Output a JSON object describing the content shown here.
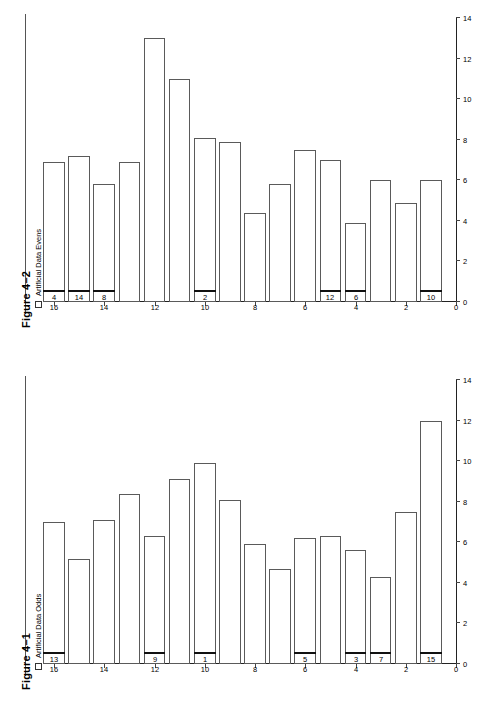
{
  "page": {
    "background": "#ffffff",
    "ink": "#000000"
  },
  "figures": [
    {
      "id": "figure-4-2",
      "title": "Figure 4–2",
      "legend": {
        "label": "Artificial Data Evens",
        "marker": "open-square"
      },
      "chart_data": {
        "type": "bar",
        "orientation": "horizontal-rotated",
        "title": "Figure 4–2",
        "xlabel": "",
        "ylabel": "",
        "legend": [
          "Artificial Data Evens"
        ],
        "legend_position": "top-left",
        "grid": false,
        "category_axis_label": "",
        "category_ticks": [
          0,
          2,
          4,
          6,
          8,
          10,
          12,
          14,
          16
        ],
        "category_axis_range": [
          0,
          16
        ],
        "value_axis_label": "",
        "value_ticks": [
          0,
          2,
          4,
          6,
          8,
          10,
          12,
          14
        ],
        "value_axis_range": [
          0,
          14
        ],
        "categories": [
          1,
          2,
          3,
          4,
          5,
          6,
          7,
          8,
          9,
          10,
          11,
          12,
          13,
          14,
          15,
          16
        ],
        "values": [
          6.0,
          4.9,
          6.0,
          3.9,
          7.0,
          7.5,
          5.8,
          4.4,
          7.9,
          8.1,
          11.0,
          13.0,
          6.9,
          5.8,
          7.2,
          6.9
        ],
        "point_labels": [
          {
            "category": 1,
            "text": "10"
          },
          {
            "category": 4,
            "text": "6"
          },
          {
            "category": 5,
            "text": "12"
          },
          {
            "category": 10,
            "text": "2"
          },
          {
            "category": 14,
            "text": "8"
          },
          {
            "category": 15,
            "text": "14"
          },
          {
            "category": 16,
            "text": "4"
          }
        ]
      }
    },
    {
      "id": "figure-4-1",
      "title": "Figure 4–1",
      "legend": {
        "label": "Artificial Data Odds",
        "marker": "open-square"
      },
      "chart_data": {
        "type": "bar",
        "orientation": "horizontal-rotated",
        "title": "Figure 4–1",
        "xlabel": "",
        "ylabel": "",
        "legend": [
          "Artificial Data Odds"
        ],
        "legend_position": "top-left",
        "grid": false,
        "category_axis_label": "",
        "category_ticks": [
          0,
          2,
          4,
          6,
          8,
          10,
          12,
          14,
          16
        ],
        "category_axis_range": [
          0,
          16
        ],
        "value_axis_label": "",
        "value_ticks": [
          0,
          2,
          4,
          6,
          8,
          10,
          12,
          14
        ],
        "value_axis_range": [
          0,
          14
        ],
        "categories": [
          1,
          2,
          3,
          4,
          5,
          6,
          7,
          8,
          9,
          10,
          11,
          12,
          13,
          14,
          15,
          16
        ],
        "values": [
          12.0,
          7.5,
          4.3,
          5.6,
          6.3,
          6.2,
          4.7,
          5.9,
          8.1,
          9.9,
          9.1,
          6.3,
          8.4,
          7.1,
          5.2,
          7.0
        ],
        "point_labels": [
          {
            "category": 1,
            "text": "15"
          },
          {
            "category": 3,
            "text": "7"
          },
          {
            "category": 3,
            "text": "11"
          },
          {
            "category": 4,
            "text": "3"
          },
          {
            "category": 6,
            "text": "5"
          },
          {
            "category": 10,
            "text": "1"
          },
          {
            "category": 12,
            "text": "9"
          },
          {
            "category": 16,
            "text": "13"
          }
        ]
      }
    }
  ]
}
